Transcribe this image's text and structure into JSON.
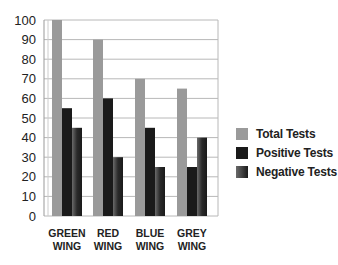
{
  "chart_data": {
    "type": "bar",
    "title": "",
    "xlabel": "",
    "ylabel": "",
    "categories": [
      "GREEN WING",
      "RED WING",
      "BLUE WING",
      "GREY WING"
    ],
    "category_lines": [
      [
        "GREEN",
        "WING"
      ],
      [
        "RED",
        "WING"
      ],
      [
        "BLUE",
        "WING"
      ],
      [
        "GREY",
        "WING"
      ]
    ],
    "series": [
      {
        "name": "Total Tests",
        "values": [
          100,
          90,
          70,
          65
        ],
        "color": "#9a9a9a"
      },
      {
        "name": "Positive Tests",
        "values": [
          55,
          60,
          45,
          25
        ],
        "color": "#1a1a1a"
      },
      {
        "name": "Negative Tests",
        "values": [
          45,
          30,
          25,
          40
        ],
        "color": "#3a3a3a"
      }
    ],
    "ylim": [
      0,
      100
    ],
    "yticks": [
      0,
      10,
      20,
      30,
      40,
      50,
      60,
      70,
      80,
      90,
      100
    ],
    "grid": true,
    "legend_position": "right"
  },
  "legend": {
    "items": [
      {
        "label": "Total Tests"
      },
      {
        "label": "Positive Tests"
      },
      {
        "label": "Negative Tests"
      }
    ]
  }
}
